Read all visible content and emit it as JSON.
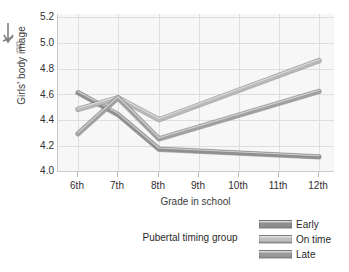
{
  "figure": {
    "artifact_name": "scan-arrow-mark"
  },
  "chart_data": {
    "type": "line",
    "title": "",
    "xlabel": "Grade in school",
    "ylabel": "Girls' body image",
    "categories": [
      "6th",
      "7th",
      "8th",
      "9th",
      "10th",
      "11th",
      "12th"
    ],
    "x_tick_labels": [
      "6th",
      "7th",
      "8th",
      "9th",
      "10th",
      "11th",
      "12th"
    ],
    "y_tick_labels": [
      "5.2",
      "5.0",
      "4.8",
      "4.6",
      "4.4",
      "4.2",
      "4.0"
    ],
    "y_tick_values": [
      5.2,
      5.0,
      4.8,
      4.6,
      4.4,
      4.2,
      4.0
    ],
    "ylim": [
      4.0,
      5.2
    ],
    "xlim": [
      0,
      6
    ],
    "grid": true,
    "legend_position": "bottom-right",
    "legend_title": "Pubertal timing group",
    "series": [
      {
        "name": "Early",
        "color": "#8f8f8f",
        "x": [
          "6th",
          "7th",
          "8th",
          "12th"
        ],
        "values": [
          4.61,
          4.44,
          4.17,
          4.11
        ]
      },
      {
        "name": "On time",
        "color": "#b8b8b8",
        "x": [
          "6th",
          "7th",
          "8th",
          "12th"
        ],
        "values": [
          4.48,
          4.57,
          4.4,
          4.86
        ]
      },
      {
        "name": "Late",
        "color": "#a0a0a0",
        "x": [
          "6th",
          "7th",
          "8th",
          "12th"
        ],
        "values": [
          4.29,
          4.57,
          4.25,
          4.62
        ]
      }
    ]
  },
  "legend": {
    "title": "Pubertal timing group",
    "entries": [
      {
        "label": "Early",
        "color": "#8f8f8f"
      },
      {
        "label": "On time",
        "color": "#bfbfbf"
      },
      {
        "label": "Late",
        "color": "#9a9a9a"
      }
    ]
  },
  "colors": {
    "panel_background": "#f7f7f7",
    "gridline": "#dedede",
    "axis": "#c9c9c9",
    "text": "#2b2b2b"
  }
}
